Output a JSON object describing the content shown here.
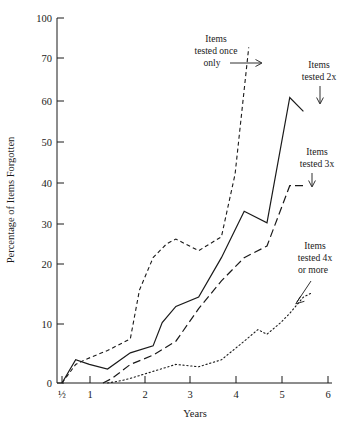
{
  "chart_data": {
    "type": "line",
    "title": "",
    "xlabel": "Years",
    "ylabel": "Percentage of Items Forgotten",
    "xlim": [
      0,
      6.2
    ],
    "ylim": [
      0,
      100
    ],
    "grid": false,
    "legend_position": "inline-annotations",
    "x_ticks": [
      {
        "value": 0.5,
        "label": "½"
      },
      {
        "value": 1,
        "label": "1"
      },
      {
        "value": 2,
        "label": "2"
      },
      {
        "value": 3,
        "label": "3"
      },
      {
        "value": 4,
        "label": "4"
      },
      {
        "value": 5,
        "label": "5"
      },
      {
        "value": 6,
        "label": "6"
      }
    ],
    "y_ticks": [
      {
        "value": 0,
        "label": "0"
      },
      {
        "value": 10,
        "label": "10"
      },
      {
        "value": 20,
        "label": "20"
      },
      {
        "value": 30,
        "label": "30"
      },
      {
        "value": 40,
        "label": "40"
      },
      {
        "value": 50,
        "label": "50"
      },
      {
        "value": 60,
        "label": "60"
      },
      {
        "value": 70,
        "label": "70"
      },
      {
        "value": 100,
        "label": "100"
      }
    ],
    "y_axis_note": "axis is compressed between 70 and 100",
    "series": [
      {
        "name": "Items tested once only",
        "style": "dashed",
        "x": [
          0.5,
          0.8,
          1.0,
          1.5,
          2.0,
          2.2,
          2.5,
          2.8,
          3.0,
          3.3,
          3.5,
          4.0,
          4.3,
          4.6
        ],
        "values": [
          0,
          4,
          5,
          7,
          9.5,
          20,
          27,
          30,
          31,
          29.5,
          28.5,
          31.5,
          45,
          78
        ]
      },
      {
        "name": "Items tested 2x",
        "style": "solid",
        "x": [
          0.5,
          0.8,
          1.1,
          1.5,
          2.0,
          2.5,
          2.7,
          3.0,
          3.5,
          4.0,
          4.5,
          5.0,
          5.5,
          5.8
        ],
        "values": [
          0,
          5,
          4,
          3,
          6.5,
          8,
          13,
          16.5,
          18.5,
          27,
          37,
          34.5,
          61.5,
          58.5
        ]
      },
      {
        "name": "Items tested 3x",
        "style": "long-dash",
        "x": [
          1.4,
          1.6,
          2.0,
          2.5,
          3.0,
          3.5,
          4.0,
          4.5,
          5.0,
          5.5,
          5.8
        ],
        "values": [
          0,
          1,
          4,
          6,
          9,
          16,
          22,
          27,
          29.5,
          42.5,
          42.5
        ]
      },
      {
        "name": "Items tested 4x or more",
        "style": "dotted",
        "x": [
          1.5,
          1.8,
          2.0,
          2.5,
          3.0,
          3.5,
          4.0,
          4.5,
          4.8,
          5.0,
          5.3,
          5.5,
          5.8,
          6.0
        ],
        "values": [
          0,
          0.5,
          1,
          2.5,
          4,
          3.5,
          5,
          9,
          11.5,
          10.5,
          13,
          15,
          18.5,
          19.5
        ]
      }
    ],
    "annotations": [
      {
        "id": "once-only",
        "lines": [
          "Items",
          "tested once",
          "only"
        ],
        "arrow": "right"
      },
      {
        "id": "tested-2x",
        "lines": [
          "Items",
          "tested 2x"
        ],
        "arrow": "down"
      },
      {
        "id": "tested-3x",
        "lines": [
          "Items",
          "tested 3x"
        ],
        "arrow": "down"
      },
      {
        "id": "tested-4x",
        "lines": [
          "Items",
          "tested 4x",
          "or more"
        ],
        "arrow": "down-left"
      }
    ]
  }
}
